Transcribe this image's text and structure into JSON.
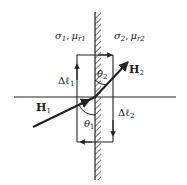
{
  "diagram": {
    "type": "boundary-conditions-magnetic-field",
    "region1": {
      "conductivity": "σ",
      "conductivity_sub": "1",
      "permeability": "μ",
      "permeability_sub": "r1"
    },
    "region2": {
      "conductivity": "σ",
      "conductivity_sub": "2",
      "permeability": "μ",
      "permeability_sub": "r2"
    },
    "vectors": {
      "h1": {
        "symbol": "H",
        "sub": "1"
      },
      "h2": {
        "symbol": "H",
        "sub": "2"
      }
    },
    "angles": {
      "theta1": {
        "symbol": "θ",
        "sub": "1"
      },
      "theta2": {
        "symbol": "θ",
        "sub": "2"
      }
    },
    "path_segments": {
      "dl1": {
        "symbol": "Δℓ",
        "sub": "1"
      },
      "dl2": {
        "symbol": "Δℓ",
        "sub": "2"
      }
    },
    "separator": ",",
    "colors": {
      "ink": "#222222",
      "background": "#ffffff"
    }
  }
}
